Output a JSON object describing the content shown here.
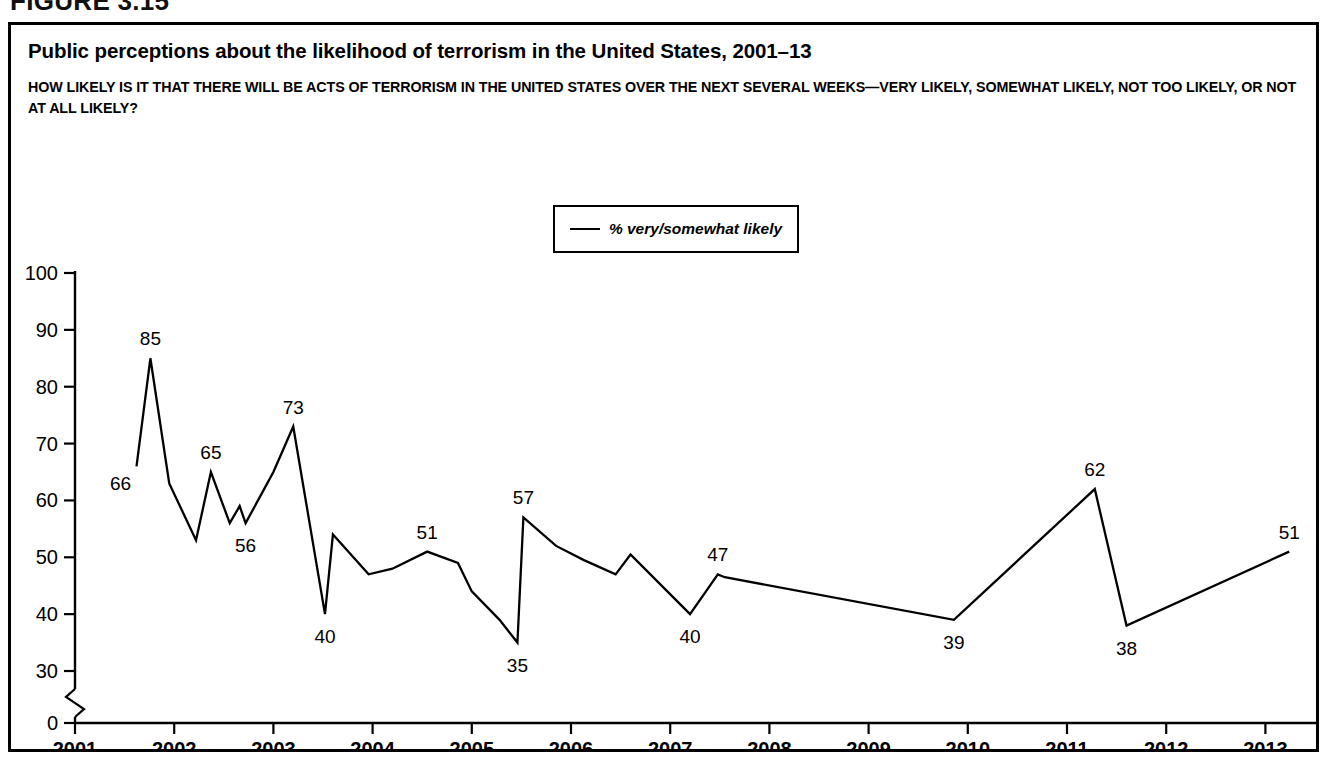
{
  "figure": {
    "label": "FIGURE 3.15"
  },
  "chart_title": "Public perceptions about the likelihood of terrorism in the United States, 2001–13",
  "chart_question": "HOW LIKELY IS IT THAT THERE WILL BE ACTS OF TERRORISM IN THE UNITED STATES OVER THE NEXT SEVERAL WEEKS—VERY LIKELY, SOMEWHAT LIKELY, NOT TOO LIKELY, OR NOT AT ALL LIKELY?",
  "legend": {
    "label": "% very/somewhat likely",
    "swatch": "line-swatch",
    "position": "top-center"
  },
  "colors": {
    "line": "#000000",
    "axis": "#000000",
    "background": "#ffffff",
    "frame": "#000000"
  },
  "chart_data": {
    "type": "line",
    "title": "Public perceptions about the likelihood of terrorism in the United States, 2001–13",
    "subtitle": "HOW LIKELY IS IT THAT THERE WILL BE ACTS OF TERRORISM IN THE UNITED STATES OVER THE NEXT SEVERAL WEEKS—VERY LIKELY, SOMEWHAT LIKELY, NOT TOO LIKELY, OR NOT AT ALL LIKELY?",
    "xlabel": "",
    "ylabel": "",
    "xlim": [
      2001.0,
      2013.5
    ],
    "ylim": [
      0,
      100
    ],
    "y_ticks": [
      0,
      30,
      40,
      50,
      60,
      70,
      80,
      90,
      100
    ],
    "y_axis_break": {
      "between": [
        0,
        30
      ],
      "style": "zigzag"
    },
    "x_ticks": [
      2001,
      2002,
      2003,
      2004,
      2005,
      2006,
      2007,
      2008,
      2009,
      2010,
      2011,
      2012,
      2013
    ],
    "grid": false,
    "legend_position": "top-center",
    "series": [
      {
        "name": "% very/somewhat likely",
        "color": "#000000",
        "x": [
          2001.62,
          2001.76,
          2001.95,
          2002.22,
          2002.37,
          2002.56,
          2002.66,
          2002.72,
          2003.0,
          2003.2,
          2003.52,
          2003.6,
          2003.96,
          2004.2,
          2004.55,
          2004.86,
          2005.0,
          2005.28,
          2005.46,
          2005.52,
          2005.85,
          2006.13,
          2006.45,
          2006.6,
          2007.2,
          2007.48,
          2007.55,
          2009.86,
          2011.28,
          2011.6,
          2013.24
        ],
        "y": [
          66,
          85,
          63,
          53,
          65,
          56,
          59,
          56,
          65,
          73,
          40,
          54,
          47,
          48,
          51,
          49,
          44,
          39,
          35,
          57,
          52,
          49.5,
          47,
          50.5,
          40,
          47,
          46.5,
          39,
          62,
          38,
          51
        ],
        "point_labels": [
          {
            "x": 2001.62,
            "y": 66,
            "text": "66",
            "placement": "below-left"
          },
          {
            "x": 2001.76,
            "y": 85,
            "text": "85",
            "placement": "above"
          },
          {
            "x": 2002.37,
            "y": 65,
            "text": "65",
            "placement": "above"
          },
          {
            "x": 2002.72,
            "y": 56,
            "text": "56",
            "placement": "below"
          },
          {
            "x": 2003.2,
            "y": 73,
            "text": "73",
            "placement": "above"
          },
          {
            "x": 2003.52,
            "y": 40,
            "text": "40",
            "placement": "below"
          },
          {
            "x": 2004.55,
            "y": 51,
            "text": "51",
            "placement": "above"
          },
          {
            "x": 2005.46,
            "y": 35,
            "text": "35",
            "placement": "below"
          },
          {
            "x": 2005.52,
            "y": 57,
            "text": "57",
            "placement": "above"
          },
          {
            "x": 2007.2,
            "y": 40,
            "text": "40",
            "placement": "below"
          },
          {
            "x": 2007.48,
            "y": 47,
            "text": "47",
            "placement": "above"
          },
          {
            "x": 2009.86,
            "y": 39,
            "text": "39",
            "placement": "below"
          },
          {
            "x": 2011.28,
            "y": 62,
            "text": "62",
            "placement": "above"
          },
          {
            "x": 2011.6,
            "y": 38,
            "text": "38",
            "placement": "below"
          },
          {
            "x": 2013.24,
            "y": 51,
            "text": "51",
            "placement": "above"
          }
        ]
      }
    ]
  }
}
